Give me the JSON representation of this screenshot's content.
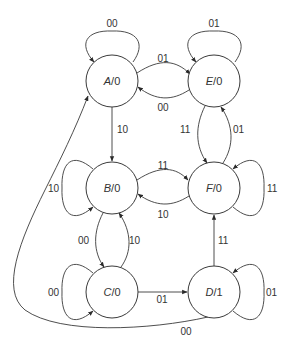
{
  "diagram": {
    "type": "state-machine",
    "kind": "Moore",
    "states": [
      {
        "id": "A",
        "name": "A",
        "output": "0",
        "label": "A/0"
      },
      {
        "id": "B",
        "name": "B",
        "output": "0",
        "label": "B/0"
      },
      {
        "id": "C",
        "name": "C",
        "output": "0",
        "label": "C/0"
      },
      {
        "id": "D",
        "name": "D",
        "output": "1",
        "label": "D/1"
      },
      {
        "id": "E",
        "name": "E",
        "output": "0",
        "label": "E/0"
      },
      {
        "id": "F",
        "name": "F",
        "output": "0",
        "label": "F/0"
      }
    ],
    "transitions": [
      {
        "from": "A",
        "to": "A",
        "input": "00"
      },
      {
        "from": "A",
        "to": "E",
        "input": "01"
      },
      {
        "from": "E",
        "to": "A",
        "input": "00"
      },
      {
        "from": "E",
        "to": "E",
        "input": "01"
      },
      {
        "from": "A",
        "to": "B",
        "input": "10"
      },
      {
        "from": "E",
        "to": "F",
        "input": "11"
      },
      {
        "from": "F",
        "to": "E",
        "input": "01"
      },
      {
        "from": "B",
        "to": "B",
        "input": "10"
      },
      {
        "from": "B",
        "to": "F",
        "input": "11"
      },
      {
        "from": "F",
        "to": "B",
        "input": "10"
      },
      {
        "from": "F",
        "to": "F",
        "input": "11"
      },
      {
        "from": "B",
        "to": "C",
        "input": "00"
      },
      {
        "from": "C",
        "to": "B",
        "input": "10"
      },
      {
        "from": "C",
        "to": "C",
        "input": "00"
      },
      {
        "from": "C",
        "to": "D",
        "input": "01"
      },
      {
        "from": "D",
        "to": "F",
        "input": "11"
      },
      {
        "from": "D",
        "to": "D",
        "input": "01"
      },
      {
        "from": "D",
        "to": "A",
        "input": "00"
      }
    ],
    "labels": {
      "state_A_name": "A",
      "state_A_out": "/0",
      "state_B_name": "B",
      "state_B_out": "/0",
      "state_C_name": "C",
      "state_C_out": "/0",
      "state_D_name": "D",
      "state_D_out": "/1",
      "state_E_name": "E",
      "state_E_out": "/0",
      "state_F_name": "F",
      "state_F_out": "/0",
      "AA": "00",
      "AE": "01",
      "EA": "00",
      "EE": "01",
      "AB": "10",
      "EF": "11",
      "FE": "01",
      "BB": "10",
      "BF": "11",
      "FB": "10",
      "FF": "11",
      "BC": "00",
      "CB": "10",
      "CC": "00",
      "CD": "01",
      "DF": "11",
      "DD": "01",
      "DA": "00"
    }
  }
}
